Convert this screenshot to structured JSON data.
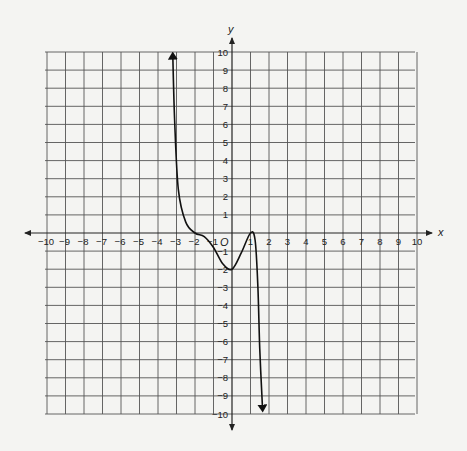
{
  "chart_data": {
    "type": "line",
    "title": "",
    "xlabel": "x",
    "ylabel": "y",
    "origin_label": "O",
    "xlim": [
      -10,
      10
    ],
    "ylim": [
      -10,
      10
    ],
    "grid": true,
    "x_ticks": [
      -10,
      -9,
      -8,
      -7,
      -6,
      -5,
      -4,
      -3,
      -2,
      -1,
      1,
      2,
      3,
      4,
      5,
      6,
      7,
      8,
      9,
      10
    ],
    "y_ticks": [
      -10,
      -9,
      -8,
      -7,
      -6,
      -5,
      -4,
      -3,
      -2,
      -1,
      1,
      2,
      3,
      4,
      5,
      6,
      7,
      8,
      9,
      10
    ],
    "series": [
      {
        "name": "f(x)",
        "description": "Polynomial curve with arrows on both ends: falls from top near x=-3, flattens through (-2,0), dips to a local minimum near (0,-2), rises to touch (1,0), then falls steeply to the bottom near x=1.6",
        "x": [
          -3.2,
          -3.1,
          -2.9,
          -2.5,
          -2.0,
          -1.5,
          -1.0,
          -0.5,
          0.0,
          0.5,
          1.0,
          1.25,
          1.4,
          1.5,
          1.65
        ],
        "y": [
          9.8,
          6.2,
          2.4,
          0.6,
          0.0,
          -0.2,
          -0.8,
          -1.7,
          -2.0,
          -1.1,
          0.0,
          -0.4,
          -3.0,
          -6.4,
          -9.7
        ]
      }
    ],
    "key_points": [
      {
        "x": -2,
        "y": 0,
        "label": "root (flat inflection)"
      },
      {
        "x": 0,
        "y": -2,
        "label": "local minimum / y-intercept"
      },
      {
        "x": 1,
        "y": 0,
        "label": "root (touches axis)"
      }
    ]
  },
  "labels": {
    "x_axis": "x",
    "y_axis": "y",
    "origin": "O"
  }
}
